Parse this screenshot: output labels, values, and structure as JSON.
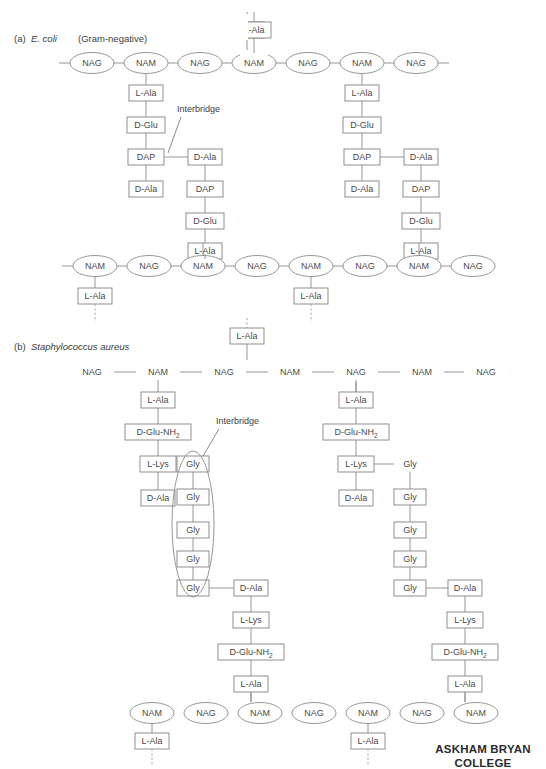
{
  "figure": {
    "title_visible": false,
    "background_color": "#ffffff",
    "stroke_color": "#8a8a8a",
    "text_color": "#4a4a4a"
  },
  "panels": [
    {
      "id": "a",
      "prefix": "(a)",
      "organism": "E. coli",
      "qualifier": "(Gram-negative)",
      "callout_label": "Interbridge",
      "glycan_row_top": [
        "NAG",
        "NAM",
        "NAG",
        "NAM",
        "NAG",
        "NAM",
        "NAG"
      ],
      "glycan_row_bottom": [
        "NAM",
        "NAG",
        "NAM",
        "NAG",
        "NAM",
        "NAG",
        "NAM",
        "NAG"
      ],
      "stem_peptide_down": [
        "L-Ala",
        "D-Glu",
        "DAP",
        "D-Ala"
      ],
      "stem_peptide_up": [
        "D-Ala",
        "DAP",
        "D-Glu",
        "L-Ala"
      ],
      "stub_label": "L-Ala",
      "node_shape": "ellipse"
    },
    {
      "id": "b",
      "prefix": "(b)",
      "organism": "Staphylococcus aureus",
      "qualifier": "",
      "callout_label": "Interbridge",
      "glycan_row_top": [
        "NAG",
        "NAM",
        "NAG",
        "NAM",
        "NAG",
        "NAM",
        "NAG",
        "NAM"
      ],
      "glycan_row_bottom": [
        "NAM",
        "NAG",
        "NAM",
        "NAG",
        "NAM",
        "NAG",
        "NAM"
      ],
      "stem_peptide_down": [
        "L-Ala",
        "D-Glu-NH2",
        "L-Lys",
        "D-Ala"
      ],
      "stem_peptide_up": [
        "D-Ala",
        "L-Lys",
        "D-Glu-NH2",
        "L-Ala"
      ],
      "interbridge_chain": [
        "Gly",
        "Gly",
        "Gly",
        "Gly",
        "Gly"
      ],
      "stub_label": "L-Ala",
      "node_shape": "text"
    }
  ],
  "labels": {
    "nag": "NAG",
    "nam": "NAM",
    "l_ala": "L-Ala",
    "d_glu": "D-Glu",
    "dap": "DAP",
    "d_ala": "D-Ala",
    "gly": "Gly",
    "l_lys": "L-Lys",
    "d_glu_nh2_main": "D-Glu-NH",
    "d_glu_nh2_sub": "2",
    "interbridge": "Interbridge"
  },
  "watermark": {
    "line1": "ASKHAM BRYAN",
    "line2": "COLLEGE"
  }
}
